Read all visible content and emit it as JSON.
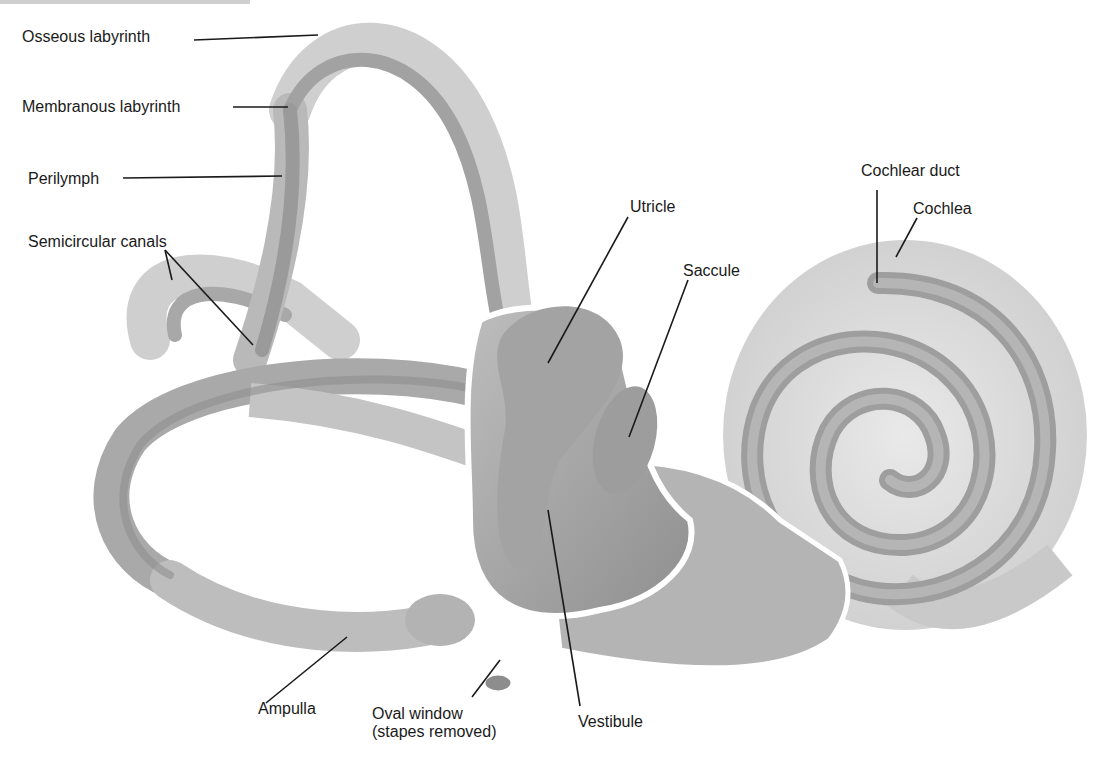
{
  "diagram": {
    "colors": {
      "background": "#ffffff",
      "tissue_light": "#d6d6d6",
      "tissue_mid": "#a8a8a8",
      "tissue_dark": "#8a8a8a",
      "outline": "#ffffff",
      "leader": "#1a1a1a",
      "text": "#1a1a1a"
    },
    "labels": {
      "osseous_labyrinth": "Osseous labyrinth",
      "membranous_labyrinth": "Membranous labyrinth",
      "perilymph": "Perilymph",
      "semicircular_canals": "Semicircular canals",
      "utricle": "Utricle",
      "saccule": "Saccule",
      "cochlear_duct": "Cochlear duct",
      "cochlea": "Cochlea",
      "ampulla": "Ampulla",
      "oval_window_line1": "Oval window",
      "oval_window_line2": "(stapes removed)",
      "vestibule": "Vestibule"
    }
  }
}
